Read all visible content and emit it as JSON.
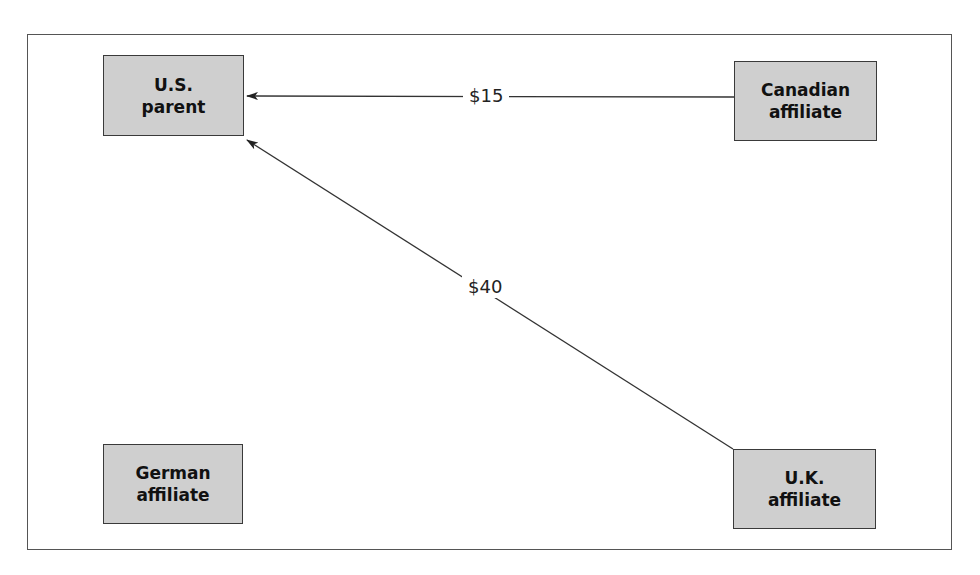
{
  "diagram": {
    "nodes": [
      {
        "id": "us_parent",
        "line1": "U.S.",
        "line2": "parent"
      },
      {
        "id": "canadian_affiliate",
        "line1": "Canadian",
        "line2": "affiliate"
      },
      {
        "id": "german_affiliate",
        "line1": "German",
        "line2": "affiliate"
      },
      {
        "id": "uk_affiliate",
        "line1": "U.K.",
        "line2": "affiliate"
      }
    ],
    "flows": [
      {
        "from": "canadian_affiliate",
        "to": "us_parent",
        "label": "$15"
      },
      {
        "from": "uk_affiliate",
        "to": "us_parent",
        "label": "$40"
      }
    ],
    "colors": {
      "box_fill": "#cfcfcf",
      "box_border": "#3a3a3a",
      "line": "#333333"
    }
  }
}
